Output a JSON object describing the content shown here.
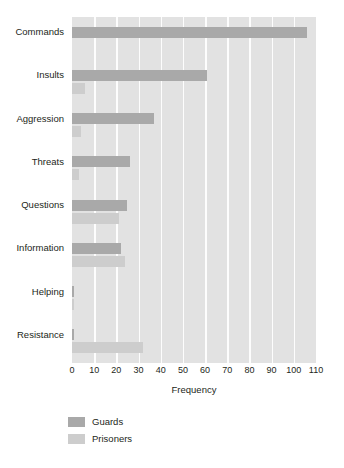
{
  "chart_data": {
    "type": "bar",
    "orientation": "horizontal",
    "title": "",
    "xlabel": "Frequency",
    "ylabel": "",
    "xlim": [
      0,
      110
    ],
    "xticks": [
      0,
      10,
      20,
      30,
      40,
      50,
      60,
      70,
      80,
      90,
      100,
      110
    ],
    "grid": true,
    "legend_position": "bottom-left",
    "categories": [
      "Commands",
      "Insults",
      "Aggression",
      "Threats",
      "Questions",
      "Information",
      "Helping",
      "Resistance"
    ],
    "series": [
      {
        "name": "Guards",
        "color": "#a9a9a9",
        "values": [
          106,
          61,
          37,
          26,
          25,
          22,
          1,
          1
        ]
      },
      {
        "name": "Prisoners",
        "color": "#cdcdcd",
        "values": [
          0,
          6,
          4,
          3,
          21,
          24,
          1,
          32
        ]
      }
    ]
  },
  "legend": {
    "items": [
      {
        "label": "Guards",
        "color": "#a9a9a9"
      },
      {
        "label": "Prisoners",
        "color": "#cdcdcd"
      }
    ]
  },
  "colors": {
    "guards": "#a9a9a9",
    "prisoners": "#cdcdcd",
    "plot_background": "#e2e2e2",
    "gridline": "#fdfdfd",
    "text": "#231f20"
  }
}
